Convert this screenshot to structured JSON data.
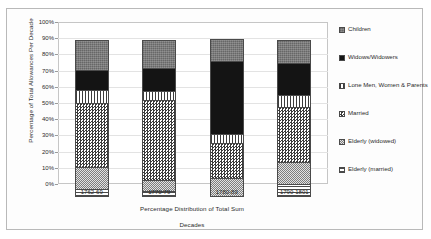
{
  "chart_data": {
    "type": "bar",
    "subtype": "stacked-percentage",
    "title": "",
    "xlabel": "Percentage Distribution of Total Sum",
    "xlabel2": "Decades",
    "ylabel": "Percentage of Total Allowances Per Decade",
    "ylim": [
      0,
      100
    ],
    "yunit": "%",
    "grid": true,
    "legend_position": "right",
    "categories": [
      "1762-69",
      "1770-79",
      "1780-89",
      "1790-1801"
    ],
    "ytick_labels": [
      "100%",
      "90%",
      "80%",
      "70%",
      "60%",
      "50%",
      "40%",
      "30%",
      "20%",
      "10%",
      "0%"
    ],
    "ytick_values": [
      100,
      90,
      80,
      70,
      60,
      50,
      40,
      30,
      20,
      10,
      0
    ],
    "series": [
      {
        "name": "Elderly (married)",
        "pattern": "horizontal-lines",
        "values": [
          5,
          4,
          0,
          8
        ]
      },
      {
        "name": "Elderly (widowed)",
        "pattern": "fine-checker-gray",
        "values": [
          14,
          7,
          12,
          14
        ]
      },
      {
        "name": "Married",
        "pattern": "checkerboard",
        "values": [
          40,
          50,
          22,
          35
        ]
      },
      {
        "name": "Lone Men, Women & Parents",
        "pattern": "vertical-lines",
        "values": [
          9,
          6,
          6,
          8
        ]
      },
      {
        "name": "Widows/Widowers",
        "pattern": "solid-black",
        "values": [
          13,
          15,
          46,
          20
        ]
      },
      {
        "name": "Children",
        "pattern": "dark-gray-texture",
        "values": [
          19,
          18,
          14,
          15
        ]
      }
    ],
    "legend_entries": [
      {
        "label": "Children",
        "pattern": "dark-gray-texture"
      },
      {
        "label": "Widows/Widowers",
        "pattern": "solid-black"
      },
      {
        "label": "Lone Men, Women & Parents",
        "pattern": "vertical-lines"
      },
      {
        "label": "Married",
        "pattern": "checkerboard"
      },
      {
        "label": "Elderly (widowed)",
        "pattern": "fine-checker-gray"
      },
      {
        "label": "Elderly (married)",
        "pattern": "horizontal-lines"
      }
    ]
  }
}
